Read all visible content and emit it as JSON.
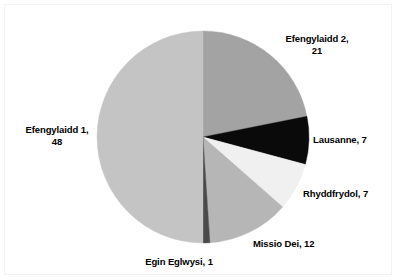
{
  "chart_data": {
    "type": "pie",
    "title": "",
    "subtitle": "",
    "xlabel": "",
    "ylabel": "",
    "legend_position": "none",
    "grid": false,
    "total": 96,
    "start_angle_deg": 0,
    "direction": "clockwise",
    "categories": [
      "Efengylaidd 2",
      "Lausanne",
      "Rhyddfrydol",
      "Missio Dei",
      "Egin Eglwysi",
      "Efengylaidd 1"
    ],
    "values": [
      21,
      7,
      7,
      12,
      1,
      48
    ],
    "slices": [
      {
        "name": "Efengylaidd 2",
        "value": 21,
        "label": "Efengylaidd 2,\n21",
        "color": "#a3a3a3",
        "start_deg": 0,
        "end_deg": 78.75,
        "percent": 21.9
      },
      {
        "name": "Lausanne",
        "value": 7,
        "label": "Lausanne, 7",
        "color": "#0a0a0a",
        "start_deg": 78.75,
        "end_deg": 105.0,
        "percent": 7.3
      },
      {
        "name": "Rhyddfrydol",
        "value": 7,
        "label": "Rhyddfrydol, 7",
        "color": "#f0f0f0",
        "start_deg": 105.0,
        "end_deg": 131.25,
        "percent": 7.3
      },
      {
        "name": "Missio Dei",
        "value": 12,
        "label": "Missio Dei, 12",
        "color": "#b6b6b6",
        "start_deg": 131.25,
        "end_deg": 176.25,
        "percent": 12.5
      },
      {
        "name": "Egin Eglwysi",
        "value": 1,
        "label": "Egin Eglwysi, 1",
        "color": "#4a4a4a",
        "start_deg": 176.25,
        "end_deg": 180.0,
        "percent": 1.0
      },
      {
        "name": "Efengylaidd 1",
        "value": 48,
        "label": "Efengylaidd 1,\n48",
        "color": "#c4c4c4",
        "start_deg": 180.0,
        "end_deg": 360.0,
        "percent": 50.0
      }
    ],
    "geometry": {
      "center_x": 203,
      "center_y": 137,
      "radius": 106
    },
    "frame_color": "#f3f3f3",
    "background_color": "#ffffff",
    "label_color": "#000000"
  }
}
